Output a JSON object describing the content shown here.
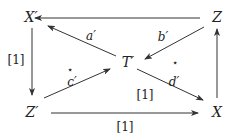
{
  "diagram": {
    "type": "commutative-diagram",
    "colors": {
      "stroke": "#333333",
      "text": "#222222",
      "background": "#ffffff"
    },
    "nodes": [
      {
        "id": "Xp",
        "label": "X′",
        "x": 20,
        "y": 17
      },
      {
        "id": "Z",
        "label": "Z",
        "x": 210,
        "y": 17
      },
      {
        "id": "Tp",
        "label": "T′",
        "x": 128,
        "y": 60
      },
      {
        "id": "Zp",
        "label": "Z′",
        "x": 30,
        "y": 105
      },
      {
        "id": "X",
        "label": "X",
        "x": 210,
        "y": 105
      }
    ],
    "edges": [
      {
        "from": "Z",
        "to": "Xp",
        "label": ""
      },
      {
        "from": "Tp",
        "to": "Xp",
        "label": "a′"
      },
      {
        "from": "Z",
        "to": "Tp",
        "label": "b′"
      },
      {
        "from": "Zp",
        "to": "Tp",
        "label": "c′"
      },
      {
        "from": "Tp",
        "to": "X",
        "label": "d′",
        "extra_label": "[1]"
      },
      {
        "from": "Xp",
        "to": "Zp",
        "label": "[1]"
      },
      {
        "from": "Zp",
        "to": "X",
        "label": "[1]"
      },
      {
        "from": "X",
        "to": "Z",
        "label": ""
      }
    ],
    "labels": {
      "a": "a′",
      "b": "b′",
      "c": "c′",
      "d": "d′",
      "shift_left": "[1]",
      "shift_center": "[1]",
      "shift_bottom": "[1]",
      "star_left": "⋆",
      "star_right": "⋆"
    },
    "node_labels": {
      "Xp": "X′",
      "Z": "Z",
      "Tp": "T′",
      "Zp": "Z′",
      "X": "X"
    }
  }
}
